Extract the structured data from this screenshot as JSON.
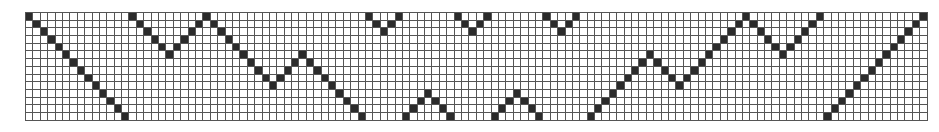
{
  "grid": {
    "columns": 122,
    "rows": 14,
    "cell_width": 6.4,
    "cell_height": 6.7,
    "filled_color": "#2b2b2b",
    "empty_color": "#ffffff",
    "line_color": "#555555",
    "filled_rows_by_column": [
      [
        0
      ],
      [
        1
      ],
      [
        2
      ],
      [
        3
      ],
      [
        4
      ],
      [
        5
      ],
      [
        6
      ],
      [
        7
      ],
      [
        8
      ],
      [
        9
      ],
      [
        10
      ],
      [
        11
      ],
      [
        12
      ],
      [
        13
      ],
      [
        0
      ],
      [
        1
      ],
      [
        2
      ],
      [
        3
      ],
      [
        4
      ],
      [
        5
      ],
      [
        4
      ],
      [
        3
      ],
      [
        2
      ],
      [
        1
      ],
      [
        0
      ],
      [
        1
      ],
      [
        2
      ],
      [
        3
      ],
      [
        4
      ],
      [
        5
      ],
      [
        6
      ],
      [
        7
      ],
      [
        8
      ],
      [
        9
      ],
      [
        8
      ],
      [
        7
      ],
      [
        6
      ],
      [
        5
      ],
      [
        6
      ],
      [
        7
      ],
      [
        8
      ],
      [
        9
      ],
      [
        10
      ],
      [
        11
      ],
      [
        12
      ],
      [
        13
      ],
      [
        0
      ],
      [
        1
      ],
      [
        2
      ],
      [
        1
      ],
      [
        0
      ],
      [
        13
      ],
      [
        12
      ],
      [
        11
      ],
      [
        10
      ],
      [
        11
      ],
      [
        12
      ],
      [
        13
      ],
      [
        0
      ],
      [
        1
      ],
      [
        2
      ],
      [
        1
      ],
      [
        0
      ],
      [
        13
      ],
      [
        12
      ],
      [
        11
      ],
      [
        10
      ],
      [
        11
      ],
      [
        12
      ],
      [
        13
      ],
      [
        0
      ],
      [
        1
      ],
      [
        2
      ],
      [
        1
      ],
      [
        0
      ],
      [],
      [
        13
      ],
      [
        12
      ],
      [
        11
      ],
      [
        10
      ],
      [
        9
      ],
      [
        8
      ],
      [
        7
      ],
      [
        6
      ],
      [
        5
      ],
      [
        6
      ],
      [
        7
      ],
      [
        8
      ],
      [
        9
      ],
      [
        8
      ],
      [
        7
      ],
      [
        6
      ],
      [
        5
      ],
      [
        4
      ],
      [
        3
      ],
      [
        2
      ],
      [
        1
      ],
      [
        0
      ],
      [
        1
      ],
      [
        2
      ],
      [
        3
      ],
      [
        4
      ],
      [
        5
      ],
      [
        4
      ],
      [
        3
      ],
      [
        2
      ],
      [
        1
      ],
      [
        0
      ],
      [
        13
      ],
      [
        12
      ],
      [
        11
      ],
      [
        10
      ],
      [
        9
      ],
      [
        8
      ],
      [
        7
      ],
      [
        6
      ],
      [
        5
      ],
      [
        4
      ],
      [
        3
      ],
      [
        2
      ],
      [
        1
      ],
      [
        0
      ]
    ]
  }
}
